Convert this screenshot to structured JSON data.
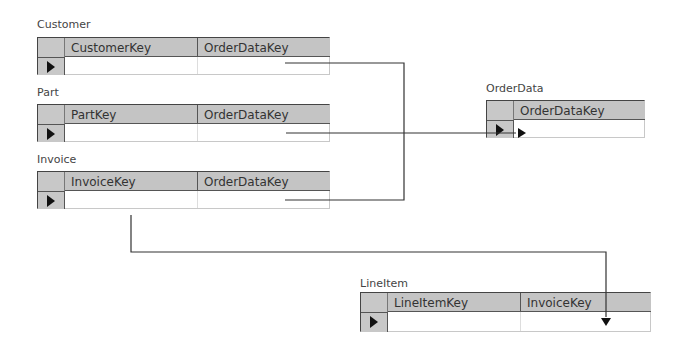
{
  "tables": [
    {
      "id": "customer",
      "title": "Customer",
      "columns": [
        "CustomerKey",
        "OrderDataKey"
      ]
    },
    {
      "id": "part",
      "title": "Part",
      "columns": [
        "PartKey",
        "OrderDataKey"
      ]
    },
    {
      "id": "invoice",
      "title": "Invoice",
      "columns": [
        "InvoiceKey",
        "OrderDataKey"
      ]
    },
    {
      "id": "orderdata",
      "title": "OrderData",
      "columns": [
        "OrderDataKey"
      ]
    },
    {
      "id": "lineitem",
      "title": "LineItem",
      "columns": [
        "LineItemKey",
        "InvoiceKey"
      ]
    }
  ],
  "relationships": [
    {
      "from": "Customer.OrderDataKey",
      "to": "OrderData.OrderDataKey"
    },
    {
      "from": "Part.OrderDataKey",
      "to": "OrderData.OrderDataKey"
    },
    {
      "from": "Invoice.OrderDataKey",
      "to": "OrderData.OrderDataKey"
    },
    {
      "from": "Invoice.InvoiceKey",
      "to": "LineItem.InvoiceKey"
    }
  ],
  "colors": {
    "header_bg": "#c4c4c4",
    "line": "#333333",
    "border": "#444444"
  }
}
